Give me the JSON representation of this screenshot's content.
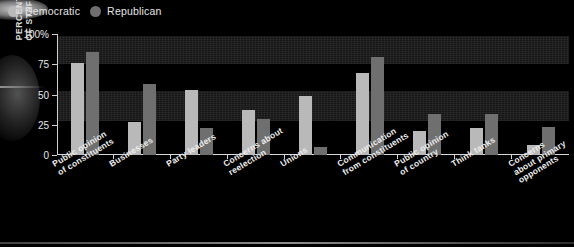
{
  "legend": {
    "position": "top-left",
    "items": [
      {
        "label": "Democratic",
        "color": "#b9b9b9",
        "marker": "circle-icon"
      },
      {
        "label": "Republican",
        "color": "#6f6f6f",
        "marker": "circle-icon"
      }
    ]
  },
  "axis": {
    "y_title_line1": "PERCENTAGE",
    "y_title_line2": "OF STAFFERS",
    "y_ticks": [
      "100%",
      "75",
      "50",
      "25",
      "0"
    ]
  },
  "chart_data": {
    "type": "bar",
    "title": "",
    "xlabel": "",
    "ylabel": "PERCENTAGE OF STAFFERS",
    "ylim": [
      0,
      100
    ],
    "yticks": [
      0,
      25,
      50,
      75,
      100
    ],
    "grid": false,
    "legend_position": "top-left",
    "categories": [
      "Public opinion of constituents",
      "Businesses",
      "Party leaders",
      "Concerns about reelection",
      "Unions",
      "Communication from constituents",
      "Public opinion of country",
      "Think tanks",
      "Concerns about primary opponents"
    ],
    "category_lines": [
      [
        "Public opinion",
        "of constituents"
      ],
      [
        "Businesses"
      ],
      [
        "Party leaders"
      ],
      [
        "Concerns about",
        "reelection"
      ],
      [
        "Unions"
      ],
      [
        "Communication",
        "from constituents"
      ],
      [
        "Public opinion",
        "of country"
      ],
      [
        "Think tanks"
      ],
      [
        "Concerns",
        "about primary",
        "opponents"
      ]
    ],
    "series": [
      {
        "name": "Democratic",
        "color": "#b9b9b9",
        "values": [
          76,
          27,
          54,
          37,
          49,
          68,
          20,
          22,
          8
        ]
      },
      {
        "name": "Republican",
        "color": "#6f6f6f",
        "values": [
          85,
          59,
          22,
          30,
          7,
          81,
          34,
          34,
          23
        ]
      }
    ]
  }
}
